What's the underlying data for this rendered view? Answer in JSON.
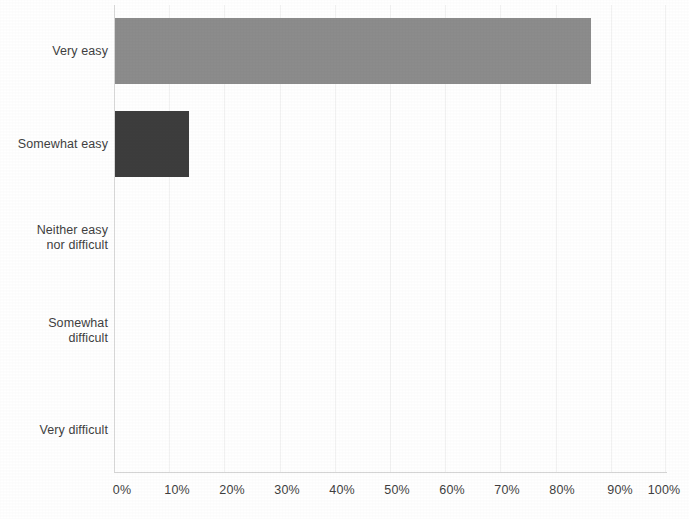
{
  "chart_data": {
    "type": "bar",
    "orientation": "horizontal",
    "title": "",
    "subtitle": "",
    "xlabel": "",
    "ylabel": "",
    "categories": [
      "Very easy",
      "Somewhat easy",
      "Neither easy\nnor difficult",
      "Somewhat\ndifficult",
      "Very difficult"
    ],
    "values": [
      86.5,
      13.5,
      0,
      0,
      0
    ],
    "value_suffix": "%",
    "xlim": [
      0,
      100
    ],
    "x_tick_labels": [
      "0%",
      "10%",
      "20%",
      "30%",
      "40%",
      "50%",
      "60%",
      "70%",
      "80%",
      "90%",
      "100%"
    ],
    "x_tick_values": [
      0,
      10,
      20,
      30,
      40,
      50,
      60,
      70,
      80,
      90,
      100
    ],
    "grid": {
      "vertical": true,
      "horizontal": false,
      "color": "#f2f2f2"
    },
    "legend": {
      "visible": false,
      "position": "none",
      "entries": []
    },
    "bar_colors": [
      "#8c8c8c",
      "#3d3d3d",
      "#8c8c8c",
      "#3d3d3d",
      "#8c8c8c"
    ],
    "annotations": [],
    "data_labels_visible": false,
    "background_color": "#ffffff",
    "axis_line_color": "#d4d4d4",
    "tick_label_color": "#3f3f3f",
    "category_label_color": "#3f3f3f"
  },
  "axis": {
    "y_axis_name": "category-axis",
    "x_axis_name": "percentage-axis"
  }
}
